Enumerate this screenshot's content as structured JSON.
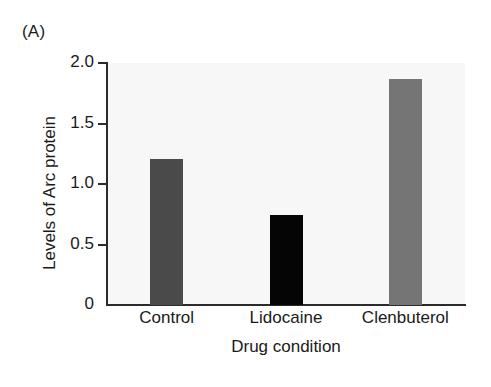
{
  "panel": {
    "label": "(A)"
  },
  "chart_data": {
    "type": "bar",
    "title": "",
    "panel_label": "(A)",
    "xlabel": "Drug condition",
    "ylabel": "Levels of Arc protein",
    "categories": [
      "Control",
      "Lidocaine",
      "Clenbuterol"
    ],
    "values": [
      1.21,
      0.74,
      1.87
    ],
    "bar_colors": [
      "#4a4a4a",
      "#050505",
      "#757575"
    ],
    "ylim": [
      0,
      2.0
    ],
    "yticks": [
      0,
      0.5,
      1.0,
      1.5,
      2.0
    ],
    "ytick_labels": [
      "0",
      "0.5",
      "1.0",
      "1.5",
      "2.0"
    ],
    "grid": false,
    "legend": "none",
    "plot_background": "#f7f7f7",
    "axis_color": "#2b2b2b",
    "spines": [
      "left",
      "bottom"
    ]
  }
}
